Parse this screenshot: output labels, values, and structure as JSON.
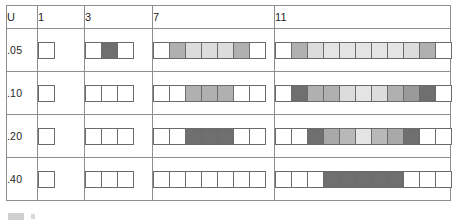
{
  "table": {
    "corner_label": "U",
    "column_headers": [
      "1",
      "3",
      "7",
      "11"
    ],
    "row_labels": [
      ".05",
      ".10",
      ".20",
      ".40"
    ],
    "palette": {
      "white": "#ffffff",
      "very_light": "#eeeeee",
      "light": "#dcdcdc",
      "light_med": "#cccccc",
      "medium": "#b0b0b0",
      "med_dark": "#9a9a9a",
      "dark": "#6f6f6f",
      "border": "#6b6b6b",
      "grid_line": "#8e8e8e"
    }
  },
  "chart_data": {
    "type": "heatmap",
    "title": "",
    "xlabel": "",
    "ylabel": "U",
    "row_variable": "U",
    "column_variable": "strip length",
    "rows": [
      ".05",
      ".10",
      ".20",
      ".40"
    ],
    "columns": [
      "1",
      "3",
      "7",
      "11"
    ],
    "grid": [
      {
        "row": ".05",
        "strips": [
          {
            "length": 1,
            "shades": [
              "#ffffff"
            ]
          },
          {
            "length": 3,
            "shades": [
              "#ffffff",
              "#6f6f6f",
              "#ffffff"
            ]
          },
          {
            "length": 7,
            "shades": [
              "#ffffff",
              "#b0b0b0",
              "#dcdcdc",
              "#dcdcdc",
              "#dcdcdc",
              "#b0b0b0",
              "#ffffff"
            ]
          },
          {
            "length": 11,
            "shades": [
              "#ffffff",
              "#b0b0b0",
              "#dcdcdc",
              "#e4e4e4",
              "#e4e4e4",
              "#e4e4e4",
              "#e4e4e4",
              "#e4e4e4",
              "#dcdcdc",
              "#b0b0b0",
              "#ffffff"
            ]
          }
        ]
      },
      {
        "row": ".10",
        "strips": [
          {
            "length": 1,
            "shades": [
              "#ffffff"
            ]
          },
          {
            "length": 3,
            "shades": [
              "#ffffff",
              "#ffffff",
              "#ffffff"
            ]
          },
          {
            "length": 7,
            "shades": [
              "#ffffff",
              "#ffffff",
              "#b0b0b0",
              "#b0b0b0",
              "#b0b0b0",
              "#ffffff",
              "#ffffff"
            ]
          },
          {
            "length": 11,
            "shades": [
              "#ffffff",
              "#6f6f6f",
              "#b0b0b0",
              "#b0b0b0",
              "#dcdcdc",
              "#e4e4e4",
              "#dcdcdc",
              "#b0b0b0",
              "#9a9a9a",
              "#6f6f6f",
              "#ffffff"
            ]
          }
        ]
      },
      {
        "row": ".20",
        "strips": [
          {
            "length": 1,
            "shades": [
              "#ffffff"
            ]
          },
          {
            "length": 3,
            "shades": [
              "#ffffff",
              "#ffffff",
              "#ffffff"
            ]
          },
          {
            "length": 7,
            "shades": [
              "#ffffff",
              "#ffffff",
              "#6f6f6f",
              "#6f6f6f",
              "#6f6f6f",
              "#ffffff",
              "#ffffff"
            ]
          },
          {
            "length": 11,
            "shades": [
              "#ffffff",
              "#ffffff",
              "#6f6f6f",
              "#a8a8a8",
              "#b8b8b8",
              "#e4e4e4",
              "#b8b8b8",
              "#a8a8a8",
              "#6f6f6f",
              "#ffffff",
              "#ffffff"
            ]
          }
        ]
      },
      {
        "row": ".40",
        "strips": [
          {
            "length": 1,
            "shades": [
              "#ffffff"
            ]
          },
          {
            "length": 3,
            "shades": [
              "#ffffff",
              "#ffffff",
              "#ffffff"
            ]
          },
          {
            "length": 7,
            "shades": [
              "#ffffff",
              "#ffffff",
              "#ffffff",
              "#ffffff",
              "#ffffff",
              "#ffffff",
              "#ffffff"
            ]
          },
          {
            "length": 11,
            "shades": [
              "#ffffff",
              "#ffffff",
              "#ffffff",
              "#6f6f6f",
              "#6f6f6f",
              "#6f6f6f",
              "#6f6f6f",
              "#6f6f6f",
              "#ffffff",
              "#ffffff",
              "#ffffff"
            ]
          }
        ]
      }
    ]
  }
}
